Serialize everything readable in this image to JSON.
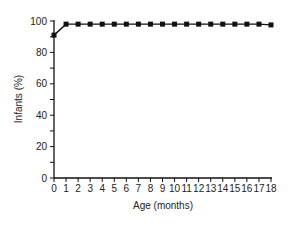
{
  "chart_data": {
    "type": "line",
    "title": "",
    "xlabel": "Age  (months)",
    "ylabel": "Infants  (%)",
    "x": [
      0,
      1,
      2,
      3,
      4,
      5,
      6,
      7,
      8,
      9,
      10,
      11,
      12,
      13,
      14,
      15,
      16,
      17,
      18
    ],
    "series": [
      {
        "name": "Infants",
        "values": [
          91,
          98,
          98,
          98,
          98,
          98,
          98,
          98,
          98,
          98,
          98,
          98,
          98,
          98,
          98,
          98,
          98,
          98,
          97.5
        ],
        "marker": "square",
        "color": "#111111"
      }
    ],
    "xlim": [
      0,
      18
    ],
    "ylim": [
      0,
      100
    ],
    "xticks": [
      "0",
      "1",
      "2",
      "3",
      "4",
      "5",
      "6",
      "7",
      "8",
      "9",
      "10",
      "11",
      "12",
      "13",
      "14",
      "15",
      "16",
      "17",
      "18"
    ],
    "yticks": [
      "0",
      "20",
      "40",
      "60",
      "80",
      "100"
    ],
    "y_minor_step": 10,
    "grid": false,
    "legend": null
  }
}
